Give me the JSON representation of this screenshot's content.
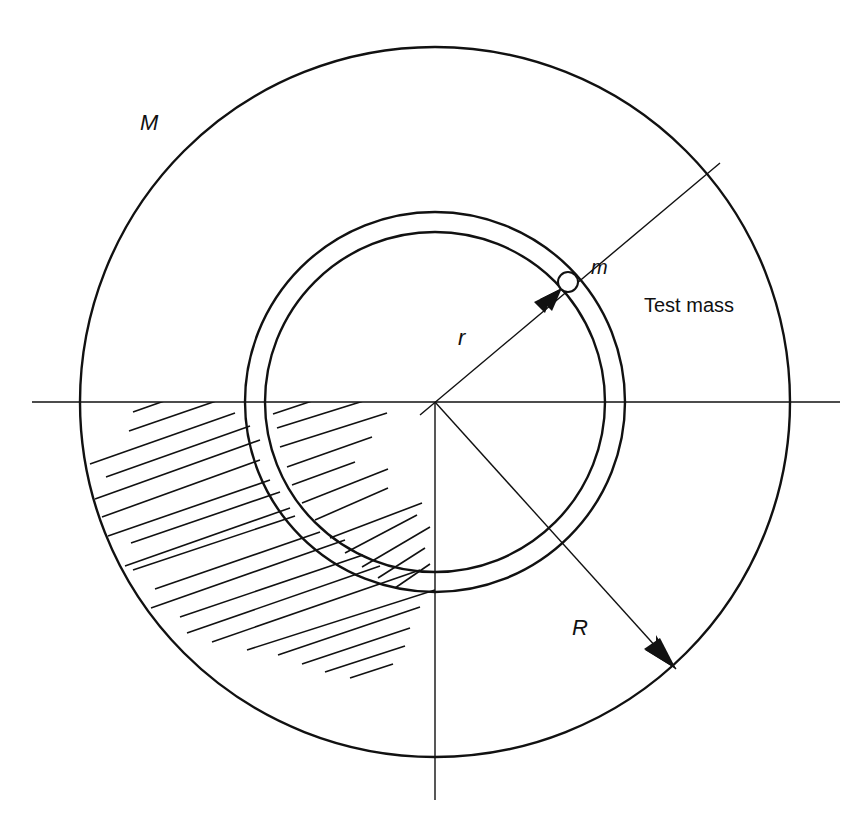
{
  "figure": {
    "type": "diagram",
    "colors": {
      "stroke": "#111111",
      "background": "#ffffff"
    },
    "center": {
      "x": 435,
      "y": 402
    },
    "outer_sphere": {
      "radius": 355
    },
    "thin_shell": {
      "outer_radius": 190,
      "inner_radius": 170
    },
    "test_mass": {
      "x": 568,
      "y": 282,
      "radius": 10
    },
    "hatched_region": "lower-left quadrant of outer mass (shaded)"
  },
  "labels": {
    "mass_M": "M",
    "test_mass_m": "m",
    "test_mass_caption": "Test mass",
    "radius_r": "r",
    "radius_R": "R"
  }
}
